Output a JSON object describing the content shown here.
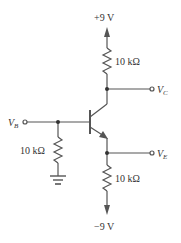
{
  "diagram": {
    "type": "BJT emitter circuit (npn transistor)",
    "colors": {
      "wire": "#555555",
      "text": "#333333",
      "background": "#ffffff"
    },
    "supply_top": {
      "label": "+9 V"
    },
    "supply_bottom": {
      "label": "−9 V"
    },
    "collector_resistor": {
      "label": "10 kΩ"
    },
    "emitter_resistor": {
      "label": "10 kΩ"
    },
    "base_resistor": {
      "label": "10 kΩ"
    },
    "terminals": {
      "collector": {
        "main": "V",
        "sub": "C"
      },
      "base": {
        "main": "V",
        "sub": "B"
      },
      "emitter": {
        "main": "V",
        "sub": "E"
      }
    },
    "ground": {
      "label": ""
    }
  }
}
